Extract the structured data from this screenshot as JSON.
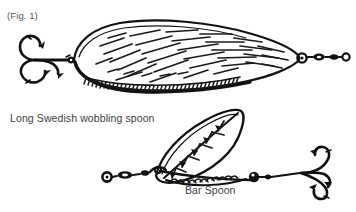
{
  "figure": {
    "number_label": "(Fig. 1)",
    "background_color": "#ffffff",
    "ink_color": "#111111",
    "text_color": "#4a4a4a",
    "width": 356,
    "height": 212,
    "medium": "black-and-white line drawing"
  },
  "lures": [
    {
      "id": "long-swedish-wobbling-spoon",
      "label": "Long Swedish wobbling spoon",
      "position": "top",
      "description": "Elongated teardrop / leaf-shaped wobbling spoon blade drawn in outline with dense diagonal hatching across the face and a serrated, scalloped shading band along the lower edge.",
      "components": [
        "treble-hook",
        "split-ring",
        "spoon-blade",
        "swivel",
        "split-ring-tail"
      ],
      "hook_side": "left",
      "swivel_side": "right"
    },
    {
      "id": "bar-spoon",
      "label": "Bar Spoon",
      "position": "bottom",
      "description": "Leaf-shaped spinner blade with a central spine and radiating veins, mounted on a straight wire bar with a bead and swivel, terminating in a treble hook.",
      "components": [
        "split-ring",
        "swivel",
        "wire-bar",
        "leaf-blade",
        "bead",
        "treble-hook"
      ],
      "hook_side": "right",
      "swivel_side": "left"
    }
  ]
}
